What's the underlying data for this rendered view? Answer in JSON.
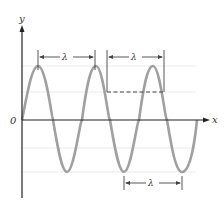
{
  "diagram": {
    "axes": {
      "x_label": "x",
      "y_label": "y",
      "origin_label": "0"
    },
    "wavelength_markers": [
      {
        "label": "λ",
        "position": "crest to crest"
      },
      {
        "label": "λ",
        "position": "between equal-phase points"
      },
      {
        "label": "λ",
        "position": "trough to trough"
      }
    ],
    "colors": {
      "wave": "#a0a0a0",
      "axis": "#222222",
      "guide": "#e6e6e6",
      "marker": "#444444"
    }
  }
}
